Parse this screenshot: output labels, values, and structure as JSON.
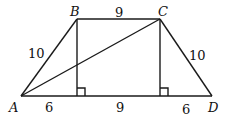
{
  "diagram": {
    "type": "trapezoid",
    "stroke_color": "#1a1a1a",
    "vertices": {
      "A": {
        "label": "A",
        "x": 21,
        "y": 96
      },
      "B": {
        "label": "B",
        "x": 77,
        "y": 19
      },
      "C": {
        "label": "C",
        "x": 160,
        "y": 19
      },
      "D": {
        "label": "D",
        "x": 212,
        "y": 96
      }
    },
    "segments": [
      {
        "from": "A",
        "to": "B",
        "label": "10"
      },
      {
        "from": "B",
        "to": "C",
        "label": "9"
      },
      {
        "from": "C",
        "to": "D",
        "label": "10"
      },
      {
        "from": "A",
        "to": "D",
        "label": ""
      },
      {
        "from": "A",
        "to": "C",
        "label": ""
      }
    ],
    "base_parts": [
      "6",
      "9",
      "6"
    ],
    "altitudes": [
      {
        "from": "B",
        "right_angle": true
      },
      {
        "from": "C",
        "right_angle": true
      }
    ]
  }
}
